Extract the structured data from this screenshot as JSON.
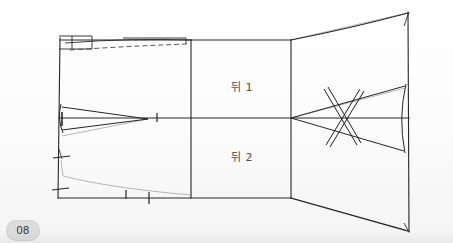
{
  "page": {
    "badge_number": "08",
    "background_color": "#fdfdfd",
    "width": 453,
    "height": 243
  },
  "figure": {
    "title": "",
    "type": "sewing-pattern-draft",
    "line_color": "#262626",
    "construction_line_color": "#8c8c8c",
    "dashed_line_color": "#4a4a4a",
    "labels": [
      {
        "id": "back-1",
        "text": "뒤 1",
        "x": 231,
        "y": 78
      },
      {
        "id": "back-2",
        "text": "뒤 2",
        "x": 231,
        "y": 148
      }
    ],
    "panels": [
      {
        "name": "left-side-panel",
        "x_range": [
          59,
          191
        ]
      },
      {
        "name": "center-panel-back-1-2",
        "x_range": [
          191,
          291
        ]
      },
      {
        "name": "right-side-panel",
        "x_range": [
          291,
          409
        ]
      }
    ],
    "outline": {
      "left_edge_top": [
        60,
        40
      ],
      "left_edge_bottom": [
        59,
        198
      ],
      "right_edge_top": [
        409,
        12
      ],
      "right_edge_bottom": [
        409,
        231
      ],
      "top_line_y": 40,
      "bottom_line_y": 198,
      "center_line_y": 118
    },
    "dividers_x": [
      191,
      291
    ],
    "darts": [
      {
        "name": "left-waist-dart",
        "apex_x": 148,
        "apex_y": 118,
        "base_x": 63
      },
      {
        "name": "right-waist-dart",
        "apex_x": 291,
        "apex_y": 118,
        "base_x": 406
      }
    ],
    "markings": [
      {
        "name": "dashed-guide-line",
        "style": "dashed",
        "from": [
          70,
          48
        ],
        "to": [
          192,
          43
        ]
      },
      {
        "name": "cross-out-mark-x",
        "x": 342,
        "y": 118
      },
      {
        "name": "notch-left-upper",
        "x": 60,
        "y": 155
      },
      {
        "name": "notch-left-lower",
        "x": 60,
        "y": 177
      },
      {
        "name": "notch-center-line",
        "x": 157,
        "y": 118
      },
      {
        "name": "notch-bottom-a",
        "x": 128,
        "y": 195
      },
      {
        "name": "notch-bottom-b",
        "x": 149,
        "y": 198
      },
      {
        "name": "corner-box-top-left",
        "x": 60,
        "y": 38
      }
    ]
  }
}
